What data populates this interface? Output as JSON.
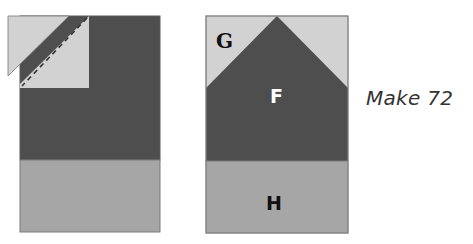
{
  "diagram": {
    "left_block": {
      "description": "Stitch-and-flip corner: light square on dark rectangle, trimmed triangle shown separated, dashed sew line",
      "pieces": [
        "light-corner-square",
        "dark-rectangle",
        "medium-bottom-strip",
        "trimmed-triangle"
      ]
    },
    "right_block": {
      "labels": {
        "G": "G",
        "F": "F",
        "H": "H"
      }
    },
    "caption": "Make 72",
    "colors": {
      "light": "#d2d2d2",
      "dark": "#4e4e4e",
      "medium": "#a6a6a6",
      "outline": "#6a6a6a",
      "label_dark": "#111111",
      "label_light": "#ffffff"
    }
  }
}
